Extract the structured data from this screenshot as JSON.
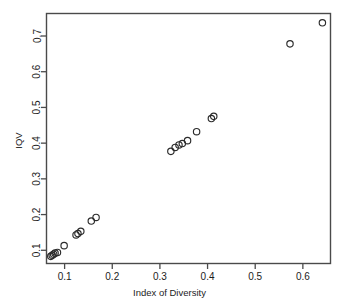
{
  "figure": {
    "top_strip_text": "",
    "background_color": "#ffffff",
    "frame_color": "#4a4a4a",
    "point_color": "#2b2b2b"
  },
  "chart_data": {
    "type": "scatter",
    "title": "",
    "xlabel": "Index of Diversity",
    "ylabel": "IQV",
    "xlim": [
      0.062,
      0.658
    ],
    "ylim": [
      0.063,
      0.763
    ],
    "xticks": [
      0.1,
      0.2,
      0.3,
      0.4,
      0.5,
      0.6
    ],
    "xtick_labels": [
      "0.1",
      "0.2",
      "0.3",
      "0.4",
      "0.5",
      "0.6"
    ],
    "yticks": [
      0.1,
      0.2,
      0.3,
      0.4,
      0.5,
      0.6,
      0.7
    ],
    "ytick_labels": [
      "0.1",
      "0.2",
      "0.3",
      "0.4",
      "0.5",
      "0.6",
      "0.7"
    ],
    "grid": false,
    "legend": null,
    "marker": "open-circle",
    "marker_size": 4,
    "points": [
      {
        "x": 0.071,
        "y": 0.083
      },
      {
        "x": 0.074,
        "y": 0.086
      },
      {
        "x": 0.077,
        "y": 0.089
      },
      {
        "x": 0.08,
        "y": 0.092
      },
      {
        "x": 0.085,
        "y": 0.094
      },
      {
        "x": 0.099,
        "y": 0.113
      },
      {
        "x": 0.124,
        "y": 0.143
      },
      {
        "x": 0.128,
        "y": 0.147
      },
      {
        "x": 0.134,
        "y": 0.153
      },
      {
        "x": 0.156,
        "y": 0.182
      },
      {
        "x": 0.166,
        "y": 0.192
      },
      {
        "x": 0.323,
        "y": 0.377
      },
      {
        "x": 0.332,
        "y": 0.388
      },
      {
        "x": 0.34,
        "y": 0.395
      },
      {
        "x": 0.347,
        "y": 0.399
      },
      {
        "x": 0.358,
        "y": 0.407
      },
      {
        "x": 0.377,
        "y": 0.432
      },
      {
        "x": 0.408,
        "y": 0.469
      },
      {
        "x": 0.413,
        "y": 0.475
      },
      {
        "x": 0.573,
        "y": 0.678
      },
      {
        "x": 0.641,
        "y": 0.737
      }
    ]
  }
}
